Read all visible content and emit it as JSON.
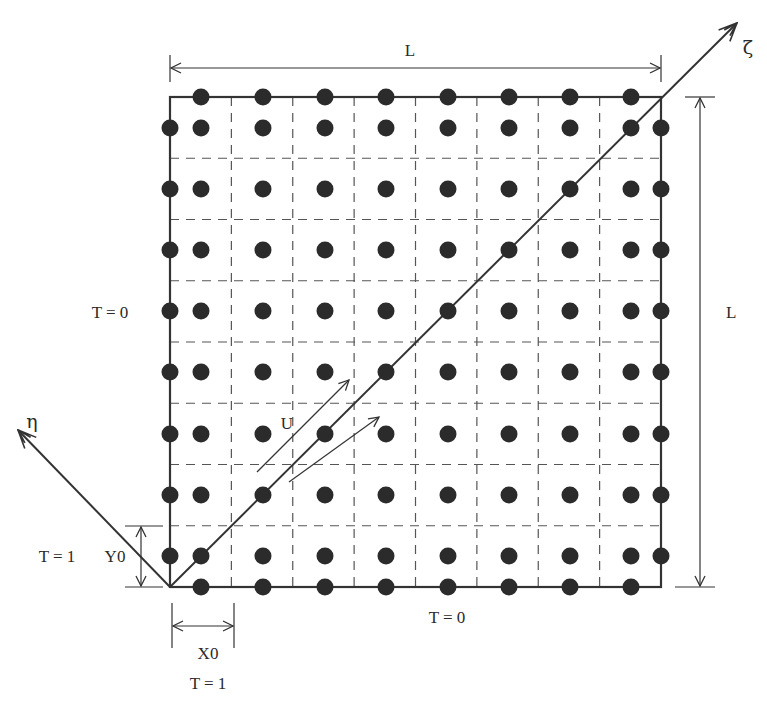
{
  "diagram": {
    "type": "computational-grid-schematic",
    "domain_square": {
      "x0": 170,
      "y0": 97,
      "x1": 661,
      "y1": 587,
      "cells": 8
    },
    "labels": {
      "top_dimension": "L",
      "right_dimension": "L",
      "left_boundary": "T = 0",
      "bottom_boundary": "T = 0",
      "left_inlet_temp": "T = 1",
      "left_inlet_height": "Y0",
      "bottom_inlet_width": "X0",
      "bottom_inlet_temp": "T = 1",
      "flow_velocity": "U",
      "axis_zeta": "ζ",
      "axis_eta": "η"
    },
    "colors": {
      "line": "#333333",
      "dot": "#2b2b2b",
      "dash": "#555555",
      "background": "#ffffff"
    },
    "dot_centers_x": [
      201,
      263,
      325,
      386,
      448,
      509,
      570,
      631
    ],
    "dot_centers_y": [
      128,
      189,
      250,
      311,
      372,
      434,
      495,
      556
    ],
    "boundary_dots": {
      "left_x": 170,
      "right_x": 661,
      "top_y": 97,
      "bottom_y": 587
    }
  }
}
